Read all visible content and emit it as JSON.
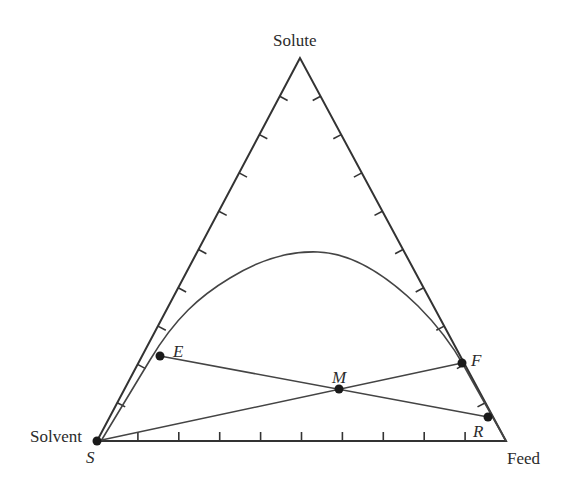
{
  "diagram": {
    "type": "ternary-phase-diagram",
    "vertices": {
      "top": {
        "label": "Solute",
        "x": 300,
        "y": 58
      },
      "bottom_left": {
        "label": "Solvent",
        "point_label": "S",
        "x": 97,
        "y": 441
      },
      "bottom_right": {
        "label": "Feed",
        "x": 506,
        "y": 441
      }
    },
    "ticks_per_edge": 9,
    "points": [
      {
        "id": "S",
        "label": "S",
        "x": 97,
        "y": 441
      },
      {
        "id": "E",
        "label": "E",
        "x": 160,
        "y": 356
      },
      {
        "id": "M",
        "label": "M",
        "x": 339,
        "y": 389
      },
      {
        "id": "F",
        "label": "F",
        "x": 462,
        "y": 363
      },
      {
        "id": "R",
        "label": "R",
        "x": 488,
        "y": 417
      }
    ],
    "lines": [
      {
        "name": "tie-line-E-R",
        "from": "E",
        "to": "R"
      },
      {
        "name": "mixing-line-S-F",
        "from": "S",
        "to": "F"
      }
    ],
    "binodal_curve": {
      "description": "Solubility (binodal) curve from Solvent corner, peaking near center, to Feed corner",
      "peak": {
        "x": 313,
        "y": 251
      }
    },
    "colors": {
      "line": "#333333",
      "point": "#1a1a1a",
      "text": "#2b2b2b",
      "background": "#ffffff"
    }
  },
  "labels": {
    "solute": "Solute",
    "solvent": "Solvent",
    "feed": "Feed",
    "S": "S",
    "E": "E",
    "M": "M",
    "F": "F",
    "R": "R"
  }
}
